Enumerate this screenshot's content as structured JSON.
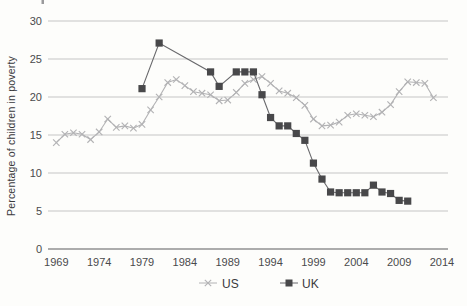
{
  "figure": {
    "background": "#fdfdfb",
    "y_axis_label": "Percentage of children in poverty"
  },
  "style": {
    "grid_color": "#c5c5c5",
    "baseline_color": "#909092",
    "tick_text_color": "#4a4a4c",
    "axis_title_color": "#39393b",
    "us_color": "#b2b2b4",
    "uk_line_color": "#69696c",
    "uk_marker_color": "#48484a"
  },
  "chart_data": {
    "type": "line",
    "title": "",
    "xlabel": "",
    "ylabel": "Percentage of children in poverty",
    "xlim": [
      1968,
      2014.7
    ],
    "ylim": [
      0,
      30
    ],
    "xticks": [
      1969,
      1974,
      1979,
      1984,
      1989,
      1994,
      1999,
      2004,
      2009,
      2014
    ],
    "yticks": [
      0,
      5,
      10,
      15,
      20,
      25,
      30
    ],
    "grid": "horizontal-only",
    "legend_position": "bottom-center",
    "series": [
      {
        "name": "US",
        "marker": "x",
        "line_color": "#b2b2b4",
        "marker_color": "#b2b2b4",
        "years": [
          1969,
          1970,
          1971,
          1972,
          1973,
          1974,
          1975,
          1976,
          1977,
          1978,
          1979,
          1980,
          1981,
          1982,
          1983,
          1984,
          1985,
          1986,
          1987,
          1988,
          1989,
          1990,
          1991,
          1992,
          1993,
          1994,
          1995,
          1996,
          1997,
          1998,
          1999,
          2000,
          2001,
          2002,
          2003,
          2004,
          2005,
          2006,
          2007,
          2008,
          2009,
          2010,
          2011,
          2012,
          2013
        ],
        "values": [
          14.0,
          15.1,
          15.3,
          15.1,
          14.4,
          15.4,
          17.1,
          16.0,
          16.2,
          15.9,
          16.4,
          18.3,
          20.0,
          21.9,
          22.3,
          21.5,
          20.7,
          20.5,
          20.3,
          19.5,
          19.6,
          20.6,
          21.8,
          22.3,
          22.7,
          21.8,
          20.8,
          20.5,
          19.9,
          18.9,
          17.1,
          16.2,
          16.3,
          16.7,
          17.6,
          17.8,
          17.6,
          17.4,
          18.0,
          19.0,
          20.7,
          22.0,
          21.9,
          21.8,
          19.9
        ]
      },
      {
        "name": "UK",
        "marker": "square",
        "line_color": "#69696c",
        "marker_color": "#48484a",
        "years": [
          1979,
          1981,
          1987,
          1988,
          1990,
          1991,
          1992,
          1993,
          1994,
          1995,
          1996,
          1997,
          1998,
          1999,
          2000,
          2001,
          2002,
          2003,
          2004,
          2005,
          2006,
          2007,
          2008,
          2009,
          2010
        ],
        "values": [
          21.1,
          27.1,
          23.3,
          21.4,
          23.3,
          23.3,
          23.3,
          20.3,
          17.3,
          16.2,
          16.2,
          15.2,
          14.3,
          11.3,
          9.2,
          7.5,
          7.4,
          7.4,
          7.4,
          7.4,
          8.4,
          7.5,
          7.3,
          6.4,
          6.3
        ]
      }
    ]
  }
}
